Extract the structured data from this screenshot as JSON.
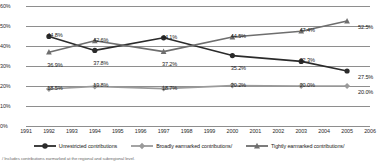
{
  "chart_data": {
    "type": "line",
    "title": "",
    "xlabel": "",
    "ylabel": "",
    "ylim": [
      0,
      60
    ],
    "grid": true,
    "legend_position": "bottom",
    "yticks": [
      "0%",
      "10%",
      "20%",
      "30%",
      "40%",
      "50%",
      "60%"
    ],
    "xticks": [
      "1991",
      "1992",
      "1993",
      "1994",
      "1995",
      "1996",
      "1997",
      "1998",
      "1999",
      "2000",
      "2001",
      "2002",
      "2003",
      "2004",
      "2005",
      "2006"
    ],
    "x": [
      1992,
      1994,
      1997,
      2000,
      2003,
      2005
    ],
    "series": [
      {
        "name": "Unrestricted contributions",
        "marker": "circle",
        "color": "#2b2b2b",
        "values": [
          44.8,
          37.8,
          44.1,
          35.2,
          32.3,
          27.5
        ],
        "labels": [
          "44.8%",
          "37.8%",
          "44.1%",
          "35.2%",
          "32.3%",
          "27.5%"
        ]
      },
      {
        "name": "Broadly earmarked contributions",
        "marker": "diamond",
        "color": "#9a9a9a",
        "values": [
          18.5,
          19.8,
          18.7,
          20.2,
          20.0,
          20.0
        ],
        "labels": [
          "18.5%",
          "19.8%",
          "18.7%",
          "20.2%",
          "20.0%",
          "20.0%"
        ]
      },
      {
        "name": "Tightly earmarked contributions",
        "marker": "triangle",
        "color": "#6e6e6e",
        "values": [
          36.9,
          42.6,
          37.2,
          44.5,
          47.4,
          52.5
        ],
        "labels": [
          "36.9%",
          "42.6%",
          "37.2%",
          "44.5%",
          "47.4%",
          "52.5%"
        ]
      }
    ]
  },
  "axis": {
    "y": [
      {
        "label": "60%",
        "value": 60
      },
      {
        "label": "50%",
        "value": 50
      },
      {
        "label": "40%",
        "value": 40
      },
      {
        "label": "30%",
        "value": 30
      },
      {
        "label": "20%",
        "value": 20
      },
      {
        "label": "10%",
        "value": 10
      },
      {
        "label": "0%",
        "value": 0
      }
    ],
    "x": [
      {
        "label": "1991"
      },
      {
        "label": "1992"
      },
      {
        "label": "1993"
      },
      {
        "label": "1994"
      },
      {
        "label": "1995"
      },
      {
        "label": "1996"
      },
      {
        "label": "1997"
      },
      {
        "label": "1998"
      },
      {
        "label": "1999"
      },
      {
        "label": "2000"
      },
      {
        "label": "2001"
      },
      {
        "label": "2002"
      },
      {
        "label": "2003"
      },
      {
        "label": "2004"
      },
      {
        "label": "2005"
      },
      {
        "label": "2006"
      }
    ]
  },
  "legend": {
    "items": [
      {
        "label": "Unrestricted contributions",
        "marker": "circle-marker-icon",
        "color": "#2b2b2b"
      },
      {
        "label": "Broadly earmarked contributions/",
        "marker": "diamond-marker-icon",
        "color": "#9a9a9a"
      },
      {
        "label": "Tightly earmarked contributions/",
        "marker": "triangle-marker-icon",
        "color": "#6e6e6e"
      }
    ]
  },
  "footnote": {
    "text": "/ Includes contributions earmarked at the regional and subregional level."
  }
}
